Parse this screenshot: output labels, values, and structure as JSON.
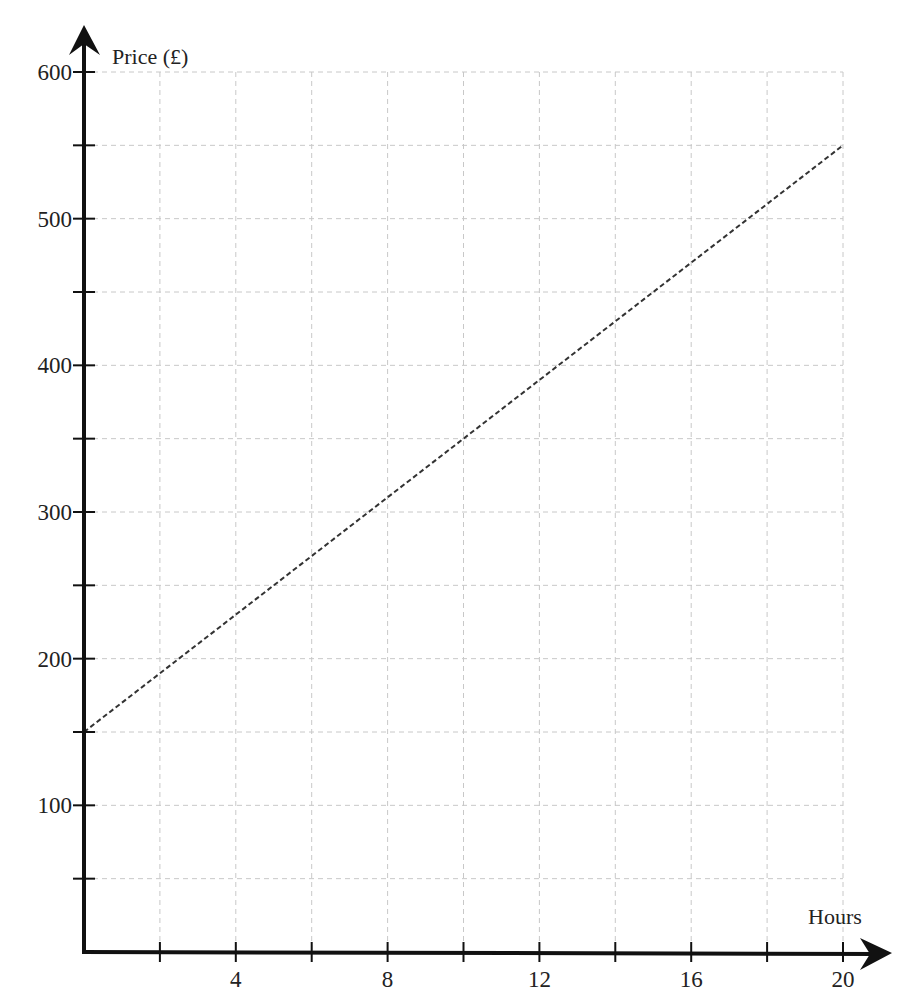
{
  "chart_data": {
    "type": "line",
    "title": "",
    "xlabel": "Hours",
    "ylabel": "Price (£)",
    "xlim": [
      0,
      20
    ],
    "ylim": [
      0,
      600
    ],
    "grid": true,
    "x_minor_step": 2,
    "y_minor_step": 50,
    "x_tick_labels": [
      {
        "value": 4,
        "label": "4"
      },
      {
        "value": 8,
        "label": "8"
      },
      {
        "value": 12,
        "label": "12"
      },
      {
        "value": 16,
        "label": "16"
      },
      {
        "value": 20,
        "label": "20"
      }
    ],
    "y_tick_labels": [
      {
        "value": 100,
        "label": "100"
      },
      {
        "value": 200,
        "label": "200"
      },
      {
        "value": 300,
        "label": "300"
      },
      {
        "value": 400,
        "label": "400"
      },
      {
        "value": 500,
        "label": "500"
      },
      {
        "value": 600,
        "label": "600"
      }
    ],
    "series": [
      {
        "name": "Price",
        "style": "dashed",
        "color": "#333333",
        "points": [
          [
            0,
            150
          ],
          [
            20,
            550
          ]
        ]
      }
    ]
  }
}
